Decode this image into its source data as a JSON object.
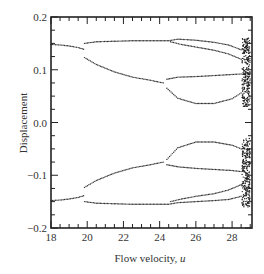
{
  "chart_data": {
    "type": "scatter",
    "title": "",
    "xlabel": "Flow velocity, u",
    "xlabel_main": "Flow velocity, ",
    "xlabel_var": "u",
    "ylabel": "Displacement",
    "xlim": [
      18,
      29.1
    ],
    "ylim": [
      -0.2,
      0.2
    ],
    "grid": false,
    "legend": null,
    "x_ticks": [
      18,
      20,
      22,
      24,
      26,
      28
    ],
    "x_tick_labels": [
      "18",
      "20",
      "22",
      "24",
      "26",
      "28"
    ],
    "y_ticks": [
      0.2,
      0.1,
      0.0,
      -0.1,
      -0.2
    ],
    "y_tick_labels": [
      "0.2",
      "0.1",
      "0.0",
      "−0.1",
      "−0.2"
    ],
    "series": [
      {
        "name": "branch-period1-upper",
        "x": [
          18.0,
          18.5,
          19.0,
          19.5,
          19.8
        ],
        "y": [
          0.148,
          0.147,
          0.145,
          0.142,
          0.139
        ]
      },
      {
        "name": "branch-period1-lower",
        "x": [
          18.0,
          18.5,
          19.0,
          19.5,
          19.8
        ],
        "y": [
          -0.148,
          -0.147,
          -0.145,
          -0.142,
          -0.139
        ]
      },
      {
        "name": "branch-A-upper",
        "x": [
          19.85,
          20.5,
          21.5,
          22.5,
          23.5,
          24.5,
          25.0,
          26.0,
          27.0,
          27.8,
          28.5
        ],
        "y": [
          0.15,
          0.153,
          0.154,
          0.155,
          0.155,
          0.155,
          0.158,
          0.156,
          0.152,
          0.147,
          0.138
        ]
      },
      {
        "name": "branch-A2-upper",
        "x": [
          24.6,
          25.2,
          26.0,
          27.0,
          27.8,
          28.5
        ],
        "y": [
          0.153,
          0.148,
          0.143,
          0.137,
          0.13,
          0.12
        ]
      },
      {
        "name": "branch-B-upper",
        "x": [
          19.85,
          20.5,
          21.5,
          22.5,
          23.5,
          24.2
        ],
        "y": [
          0.123,
          0.11,
          0.096,
          0.086,
          0.08,
          0.075
        ]
      },
      {
        "name": "branch-B1-upper",
        "x": [
          24.4,
          25.0,
          26.0,
          27.0,
          28.0,
          28.5
        ],
        "y": [
          0.082,
          0.086,
          0.087,
          0.089,
          0.091,
          0.092
        ]
      },
      {
        "name": "branch-B2-upper",
        "x": [
          24.4,
          25.0,
          26.0,
          27.0,
          28.0,
          28.5
        ],
        "y": [
          0.065,
          0.046,
          0.036,
          0.036,
          0.045,
          0.056
        ]
      },
      {
        "name": "branch-A-lower",
        "x": [
          19.85,
          20.5,
          21.5,
          22.5,
          23.5,
          24.5,
          25.0,
          26.0,
          27.0,
          27.8,
          28.5
        ],
        "y": [
          -0.15,
          -0.153,
          -0.154,
          -0.155,
          -0.155,
          -0.155,
          -0.152,
          -0.15,
          -0.148,
          -0.146,
          -0.14
        ]
      },
      {
        "name": "branch-A2-lower",
        "x": [
          24.6,
          25.2,
          26.0,
          27.0,
          27.8,
          28.5
        ],
        "y": [
          -0.15,
          -0.145,
          -0.14,
          -0.135,
          -0.128,
          -0.118
        ]
      },
      {
        "name": "branch-B-lower",
        "x": [
          19.85,
          20.5,
          21.5,
          22.5,
          23.5,
          24.2
        ],
        "y": [
          -0.123,
          -0.11,
          -0.096,
          -0.086,
          -0.08,
          -0.075
        ]
      },
      {
        "name": "branch-B1-lower",
        "x": [
          24.4,
          25.0,
          26.0,
          27.0,
          28.0,
          28.5
        ],
        "y": [
          -0.07,
          -0.048,
          -0.037,
          -0.037,
          -0.043,
          -0.05
        ]
      },
      {
        "name": "branch-B2-lower",
        "x": [
          24.4,
          25.0,
          26.0,
          27.0,
          28.0,
          28.5
        ],
        "y": [
          -0.08,
          -0.084,
          -0.087,
          -0.089,
          -0.091,
          -0.093
        ]
      }
    ],
    "annotations": [
      "chaotic region near u ≈ 28.6–29 (dense scatter spanning ±0.16)"
    ],
    "chaos_region": {
      "x_min": 28.55,
      "x_max": 29.0,
      "bands": [
        [
          0.03,
          0.16
        ],
        [
          -0.16,
          -0.03
        ]
      ]
    }
  }
}
